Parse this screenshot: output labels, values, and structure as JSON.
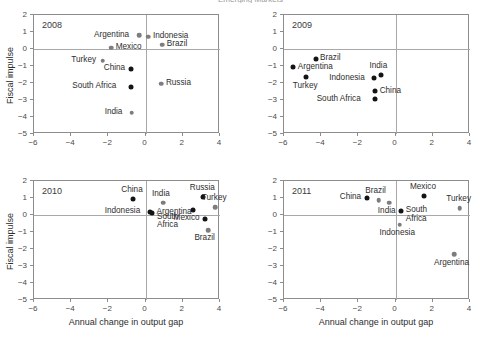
{
  "figure": {
    "clipped_title": "Emerging Markets",
    "axis": {
      "xlabel": "Annual change in output gap",
      "ylabel": "Fiscal impulse",
      "xlim": [
        -6,
        4
      ],
      "ylim": [
        -5,
        2
      ],
      "xticks": [
        -6,
        -4,
        -2,
        0,
        2,
        4
      ],
      "yticks": [
        2,
        1,
        0,
        -1,
        -2,
        -3,
        -4,
        -5
      ],
      "xticklabels": [
        "−6",
        "−4",
        "−2",
        "0",
        "2",
        "4"
      ],
      "yticklabels": [
        "2",
        "1",
        "0",
        "−1",
        "−2",
        "−3",
        "−4",
        "−5"
      ],
      "grid": false,
      "zero_lines": true
    },
    "colors": {
      "marker_dark": "#141414",
      "marker_gray": "#7d7d7d",
      "frame": "#8d8d8d",
      "zeroline": "#a8a8a8",
      "text": "#2e2e2e"
    }
  },
  "chart_data": {
    "type": "scatter",
    "title": "Emerging Markets",
    "xlabel": "Annual change in output gap",
    "ylabel": "Fiscal impulse",
    "xlim": [
      -6,
      4
    ],
    "ylim": [
      -5,
      2
    ],
    "grid": false,
    "legend": "none",
    "panels": [
      {
        "year": "2008",
        "points": [
          {
            "name": "Argentina",
            "x": -0.35,
            "y": 0.8,
            "color": "gray",
            "label_pos": "left"
          },
          {
            "name": "Indonesia",
            "x": 0.15,
            "y": 0.72,
            "color": "gray",
            "label_pos": "right"
          },
          {
            "name": "Mexico",
            "x": -1.85,
            "y": 0.08,
            "color": "gray",
            "label_pos": "right"
          },
          {
            "name": "Brazil",
            "x": 0.9,
            "y": 0.25,
            "color": "gray",
            "label_pos": "right"
          },
          {
            "name": "Turkey",
            "x": -2.3,
            "y": -0.7,
            "color": "gray",
            "label_pos": "left"
          },
          {
            "name": "China",
            "x": -0.8,
            "y": -1.18,
            "color": "dark",
            "label_pos": "left"
          },
          {
            "name": "South Africa",
            "x": -0.8,
            "y": -2.22,
            "color": "dark",
            "label_pos": "left"
          },
          {
            "name": "Russia",
            "x": 0.85,
            "y": -2.05,
            "color": "gray",
            "label_pos": "right"
          },
          {
            "name": "India",
            "x": -0.75,
            "y": -3.75,
            "color": "gray",
            "label_pos": "left"
          }
        ]
      },
      {
        "year": "2009",
        "points": [
          {
            "name": "Brazil",
            "x": -4.3,
            "y": -0.58,
            "color": "dark",
            "label_pos": "right"
          },
          {
            "name": "Argentina",
            "x": -5.5,
            "y": -1.08,
            "color": "dark",
            "label_pos": "right"
          },
          {
            "name": "India",
            "x": -0.8,
            "y": -1.52,
            "color": "dark",
            "label_pos": "above"
          },
          {
            "name": "Turkey",
            "x": -4.8,
            "y": -1.65,
            "color": "dark",
            "label_pos": "below"
          },
          {
            "name": "Indonesia",
            "x": -1.15,
            "y": -1.72,
            "color": "dark",
            "label_pos": "left"
          },
          {
            "name": "China",
            "x": -1.1,
            "y": -2.48,
            "color": "dark",
            "label_pos": "right"
          },
          {
            "name": "South Africa",
            "x": -1.1,
            "y": -2.95,
            "color": "dark",
            "label_pos": "left"
          }
        ]
      },
      {
        "year": "2010",
        "points": [
          {
            "name": "China",
            "x": -0.7,
            "y": 0.95,
            "color": "dark",
            "label_pos": "above"
          },
          {
            "name": "India",
            "x": 0.95,
            "y": 0.72,
            "color": "gray",
            "label_pos": "above"
          },
          {
            "name": "Russia",
            "x": 3.1,
            "y": 1.08,
            "color": "dark",
            "label_pos": "above"
          },
          {
            "name": "Turkey",
            "x": 3.75,
            "y": 0.45,
            "color": "gray",
            "label_pos": "above"
          },
          {
            "name": "Indonesia",
            "x": 0.22,
            "y": 0.2,
            "color": "dark",
            "label_pos": "left"
          },
          {
            "name": "Argentina",
            "x": 0.35,
            "y": 0.12,
            "color": "dark",
            "label_pos": "right"
          },
          {
            "name": "South Africa",
            "x": 2.55,
            "y": 0.32,
            "color": "dark",
            "label_pos": "belowleft"
          },
          {
            "name": "Mexico",
            "x": 3.2,
            "y": -0.22,
            "color": "dark",
            "label_pos": "left"
          },
          {
            "name": "Brazil",
            "x": 3.35,
            "y": -0.88,
            "color": "gray",
            "label_pos": "below"
          }
        ]
      },
      {
        "year": "2011",
        "points": [
          {
            "name": "China",
            "x": -1.55,
            "y": 1.02,
            "color": "dark",
            "label_pos": "left"
          },
          {
            "name": "Brazil",
            "x": -0.9,
            "y": 0.88,
            "color": "gray",
            "label_pos": "above"
          },
          {
            "name": "India",
            "x": -0.35,
            "y": 0.72,
            "color": "gray",
            "label_pos": "below"
          },
          {
            "name": "Mexico",
            "x": 1.5,
            "y": 1.1,
            "color": "dark",
            "label_pos": "above"
          },
          {
            "name": "Turkey",
            "x": 3.45,
            "y": 0.4,
            "color": "gray",
            "label_pos": "above"
          },
          {
            "name": "South Africa",
            "x": 0.3,
            "y": 0.25,
            "color": "dark",
            "label_pos": "right"
          },
          {
            "name": "Indonesia",
            "x": 0.22,
            "y": -0.58,
            "color": "gray",
            "label_pos": "below"
          },
          {
            "name": "Argentina",
            "x": 3.15,
            "y": -2.32,
            "color": "gray",
            "label_pos": "below"
          }
        ]
      }
    ]
  }
}
